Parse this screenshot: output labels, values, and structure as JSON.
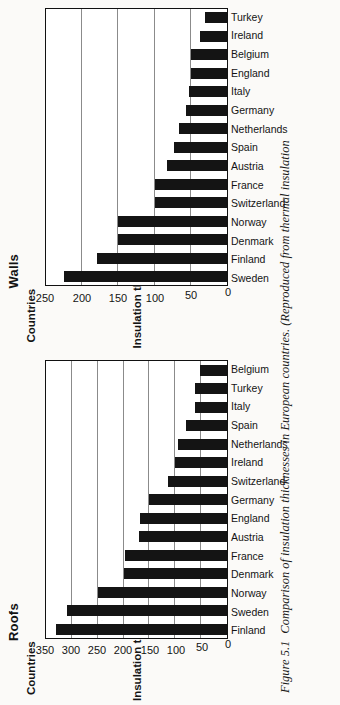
{
  "figure": {
    "caption_label": "Figure 5.1",
    "caption_text": "Comparison of insulation thicknesses in European countries. (Reproduced from thermal insulation"
  },
  "chart_data": [
    {
      "type": "bar",
      "title": "Roofs",
      "xlabel": "Countries",
      "ylabel": "Insulation thickness (mm)",
      "ylim": [
        0,
        350
      ],
      "yticks": [
        0,
        50,
        100,
        150,
        200,
        250,
        300,
        350
      ],
      "grid": true,
      "legend": "none",
      "categories": [
        "Finland",
        "Sweden",
        "Norway",
        "Denmark",
        "France",
        "Austria",
        "England",
        "Germany",
        "Switzerland",
        "Ireland",
        "Netherlands",
        "Spain",
        "Italy",
        "Turkey",
        "Belgium"
      ],
      "values": [
        330,
        310,
        250,
        200,
        198,
        170,
        168,
        150,
        115,
        100,
        95,
        80,
        62,
        62,
        52
      ]
    },
    {
      "type": "bar",
      "title": "Walls",
      "xlabel": "Countries",
      "ylabel": "Insulation thickness (mm)",
      "ylim": [
        0,
        250
      ],
      "yticks": [
        0,
        50,
        100,
        150,
        200,
        250
      ],
      "grid": true,
      "legend": "none",
      "categories": [
        "Sweden",
        "Finland",
        "Denmark",
        "Norway",
        "Switzerland",
        "France",
        "Austria",
        "Spain",
        "Netherlands",
        "Germany",
        "Italy",
        "England",
        "Belgium",
        "Ireland",
        "Turkey"
      ],
      "values": [
        225,
        180,
        150,
        150,
        100,
        100,
        83,
        73,
        67,
        57,
        52,
        50,
        50,
        38,
        30
      ]
    }
  ]
}
